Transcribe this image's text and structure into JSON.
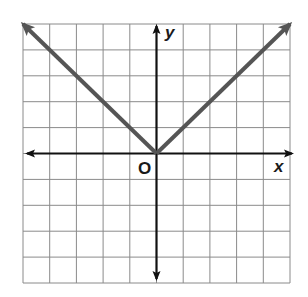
{
  "chart_data": {
    "type": "line",
    "title": "",
    "xlabel": "x",
    "ylabel": "y",
    "origin_label": "O",
    "xlim": [
      -5,
      5
    ],
    "ylim": [
      -5,
      5
    ],
    "grid": true,
    "grid_step": 1,
    "series": [
      {
        "name": "y = |x|",
        "x": [
          -5,
          0,
          5
        ],
        "y": [
          5,
          0,
          5
        ],
        "color": "#555555",
        "arrows_at_ends": true
      }
    ]
  },
  "labels": {
    "x_axis": "x",
    "y_axis": "y",
    "origin": "O"
  },
  "colors": {
    "grid": "#8a8a8a",
    "axis": "#111111",
    "curve": "#555555"
  }
}
